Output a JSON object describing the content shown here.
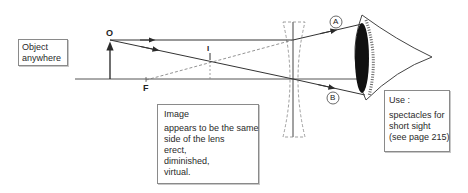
{
  "diagram": {
    "type": "ray-diagram",
    "points": {
      "object_top": "O",
      "focal_point": "F",
      "image": "I"
    },
    "rays": {
      "a": "A",
      "b": "B"
    }
  },
  "object_box": {
    "title": "Object",
    "lines": [
      "anywhere"
    ]
  },
  "image_box": {
    "title": "Image",
    "lines": [
      "appears to be the same",
      "side of the lens",
      "erect,",
      "diminished,",
      "virtual."
    ]
  },
  "use_box": {
    "title": "Use :",
    "lines": [
      "spectacles for",
      "short sight",
      "(see page 215)"
    ]
  },
  "colors": {
    "line": "#3a3a3a",
    "dashed": "#6a6a6a",
    "eye_lens": "#111111"
  }
}
